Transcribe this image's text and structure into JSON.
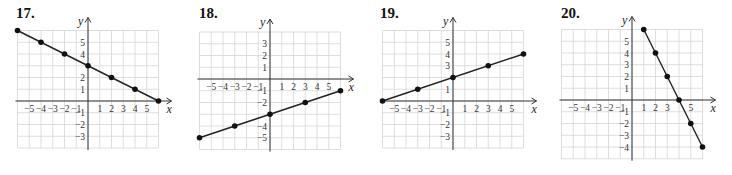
{
  "chart_data": [
    {
      "type": "line",
      "title": "17.",
      "xlabel": "x",
      "ylabel": "y",
      "xlim": [
        -6,
        6
      ],
      "ylim": [
        -4,
        6
      ],
      "grid": true,
      "x_tick_labels": [
        "-5",
        "-4",
        "-3",
        "-2",
        "-1",
        "1",
        "2",
        "3",
        "4",
        "5"
      ],
      "x_tick_values": [
        -5,
        -4,
        -3,
        -2,
        -1,
        1,
        2,
        3,
        4,
        5
      ],
      "y_tick_labels": [
        "5",
        "4",
        "2",
        "1",
        "-1",
        "-2",
        "-3"
      ],
      "y_tick_values": [
        5,
        4,
        2,
        1,
        -1,
        -2,
        -3
      ],
      "series": [
        {
          "name": "line",
          "x": [
            -6,
            -4,
            -2,
            0,
            2,
            4,
            6
          ],
          "y": [
            6,
            5,
            4,
            3,
            2,
            1,
            0
          ]
        }
      ]
    },
    {
      "type": "line",
      "title": "18.",
      "xlabel": "x",
      "ylabel": "y",
      "xlim": [
        -6,
        6
      ],
      "ylim": [
        -6,
        4
      ],
      "grid": true,
      "x_tick_labels": [
        "-5",
        "-4",
        "-3",
        "-2",
        "-1",
        "1",
        "2",
        "3",
        "4",
        "5"
      ],
      "x_tick_values": [
        -5,
        -4,
        -3,
        -2,
        -1,
        1,
        2,
        3,
        4,
        5
      ],
      "y_tick_labels": [
        "3",
        "2",
        "1",
        "-1",
        "-2",
        "-4",
        "-5"
      ],
      "y_tick_values": [
        3,
        2,
        1,
        -1,
        -2,
        -4,
        -5
      ],
      "series": [
        {
          "name": "line",
          "x": [
            -6,
            -3,
            0,
            3,
            6
          ],
          "y": [
            -5,
            -4,
            -3,
            -2,
            -1
          ]
        }
      ]
    },
    {
      "type": "line",
      "title": "19.",
      "xlabel": "x",
      "ylabel": "y",
      "xlim": [
        -6,
        6
      ],
      "ylim": [
        -4,
        6
      ],
      "grid": true,
      "x_tick_labels": [
        "-5",
        "-4",
        "-3",
        "-2",
        "-1",
        "1",
        "2",
        "3",
        "4",
        "5"
      ],
      "x_tick_values": [
        -5,
        -4,
        -3,
        -2,
        -1,
        1,
        2,
        3,
        4,
        5
      ],
      "y_tick_labels": [
        "5",
        "4",
        "3",
        "1",
        "-1",
        "-2",
        "-3"
      ],
      "y_tick_values": [
        5,
        4,
        3,
        1,
        -1,
        -2,
        -3
      ],
      "series": [
        {
          "name": "line",
          "x": [
            -6,
            -3,
            0,
            3,
            6
          ],
          "y": [
            0,
            1,
            2,
            3,
            4
          ]
        }
      ]
    },
    {
      "type": "line",
      "title": "20.",
      "xlabel": "x",
      "ylabel": "y",
      "xlim": [
        -6,
        6
      ],
      "ylim": [
        -5,
        6
      ],
      "grid": true,
      "x_tick_labels": [
        "-5",
        "-4",
        "-3",
        "-2",
        "-1",
        "1",
        "2",
        "3",
        "5"
      ],
      "x_tick_values": [
        -5,
        -4,
        -3,
        -2,
        -1,
        1,
        2,
        3,
        5
      ],
      "y_tick_labels": [
        "5",
        "4",
        "3",
        "2",
        "1",
        "-1",
        "-2",
        "-3",
        "-4"
      ],
      "y_tick_values": [
        5,
        4,
        3,
        2,
        1,
        -1,
        -2,
        -3,
        -4
      ],
      "series": [
        {
          "name": "line",
          "x": [
            1,
            2,
            3,
            4,
            5,
            6
          ],
          "y": [
            6,
            4,
            2,
            0,
            -2,
            -4
          ]
        }
      ]
    }
  ]
}
